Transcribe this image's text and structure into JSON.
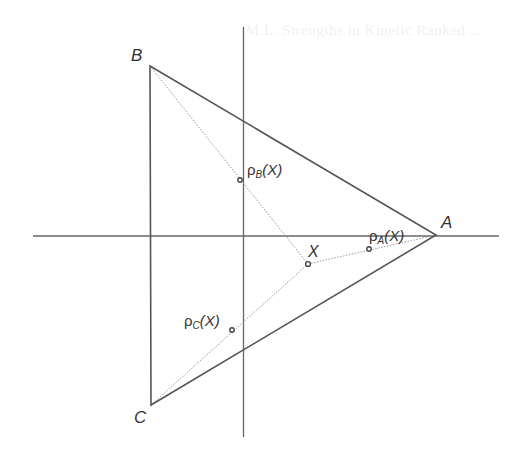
{
  "diagram": {
    "type": "geometry",
    "colors": {
      "line": "#555555",
      "axis": "#666666",
      "dotted": "#9a9a9a",
      "text": "#333333",
      "point": "#444444"
    },
    "ghost_text": "M.L. Strengths in Kinetic Ranked ...",
    "vertices": {
      "A": {
        "label": "A",
        "x": 436,
        "y": 235
      },
      "B": {
        "label": "B",
        "x": 150,
        "y": 66
      },
      "C": {
        "label": "C",
        "x": 151,
        "y": 405
      }
    },
    "axes": {
      "horizontal": {
        "x1": 33,
        "y1": 236,
        "x2": 499,
        "y2": 236
      },
      "vertical": {
        "x1": 243,
        "y1": 27,
        "x2": 244,
        "y2": 437
      }
    },
    "points": {
      "X": {
        "label": "X",
        "x": 308,
        "y": 264
      },
      "rhoA": {
        "symbol": "ρ",
        "sub": "A",
        "arg": "(X)",
        "x": 369,
        "y": 249
      },
      "rhoB": {
        "symbol": "ρ",
        "sub": "B",
        "arg": "(X)",
        "x": 240,
        "y": 180
      },
      "rhoC": {
        "symbol": "ρ",
        "sub": "C",
        "arg": "(X)",
        "x": 232,
        "y": 330
      }
    },
    "labels": {
      "A": "A",
      "B": "B",
      "C": "C",
      "X": "X"
    }
  }
}
